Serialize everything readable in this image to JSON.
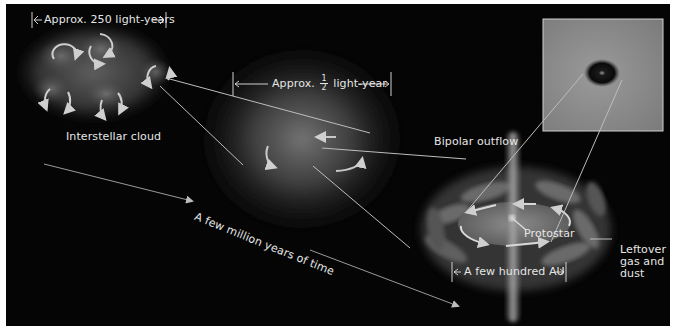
{
  "figure": {
    "stages": [
      {
        "id": "interstellar-cloud",
        "label": "Interstellar cloud",
        "scale_label": "Approx. 250 light-years"
      },
      {
        "id": "collapsing-core",
        "scale_prefix": "Approx.",
        "scale_fraction": {
          "numerator": "1",
          "denominator": "2"
        },
        "scale_suffix": "light-year"
      },
      {
        "id": "protostar-system",
        "scale_label": "A few hundred AU"
      }
    ],
    "labels": {
      "interstellar_cloud": "Interstellar cloud",
      "cloud_scale": "Approx. 250 light-years",
      "core_scale_prefix": "Approx.",
      "core_scale_num": "1",
      "core_scale_den": "2",
      "core_scale_suffix": "light-year",
      "time_arrow": "A few million years of time",
      "bipolar_outflow": "Bipolar outflow",
      "protostar": "Protostar",
      "leftover_line1": "Leftover",
      "leftover_line2": "gas and",
      "leftover_line3": "dust",
      "disk_scale": "A few hundred AU"
    },
    "inset": {
      "description": "Photograph of dark protostellar core in nebula"
    },
    "colors": {
      "background": "#050505",
      "text": "#e6e6e6",
      "arrow": "#cfcfcf",
      "glow": "#9a9a9a",
      "inset_bg": "#8c8c8c"
    }
  }
}
